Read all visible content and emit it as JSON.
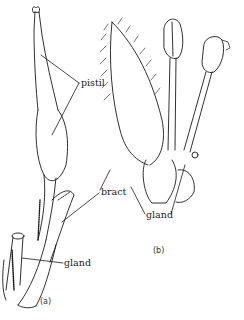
{
  "figure": {
    "panels": [
      {
        "id": "a",
        "caption": "(a)"
      },
      {
        "id": "b",
        "caption": "(b)"
      }
    ],
    "labels": {
      "pistil": "pistil",
      "bract": "bract",
      "gland_a": "gland",
      "gland_b": "gland"
    },
    "colors": {
      "ink": "#1a1a1a",
      "background": "#ffffff"
    }
  }
}
